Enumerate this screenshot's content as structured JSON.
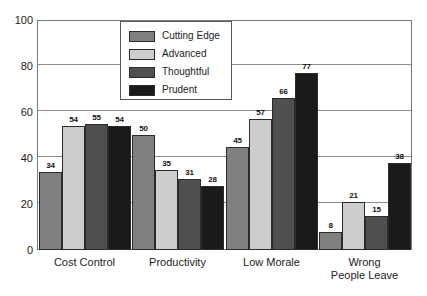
{
  "chart_data": {
    "type": "bar",
    "title": "",
    "xlabel": "",
    "ylabel": "",
    "ylim": [
      0,
      100
    ],
    "yticks": [
      "0",
      "20",
      "40",
      "60",
      "80",
      "100"
    ],
    "grid": true,
    "legend_position": "top-center-left inside plot",
    "categories": [
      "Cost Control",
      "Productivity",
      "Low Morale",
      "Wrong People Leave"
    ],
    "category_lines": [
      [
        "Cost Control"
      ],
      [
        "Productivity"
      ],
      [
        "Low Morale"
      ],
      [
        "Wrong",
        "People Leave"
      ]
    ],
    "series": [
      {
        "name": "Cutting Edge",
        "color": "#808080",
        "values": [
          34,
          50,
          45,
          8
        ]
      },
      {
        "name": "Advanced",
        "color": "#cdcdcd",
        "values": [
          54,
          35,
          57,
          21
        ]
      },
      {
        "name": "Thoughtful",
        "color": "#4f4f4f",
        "values": [
          55,
          31,
          66,
          15
        ]
      },
      {
        "name": "Prudent",
        "color": "#1a1a1a",
        "values": [
          54,
          28,
          77,
          38
        ]
      }
    ]
  },
  "legend": {
    "items": [
      {
        "label": "Cutting Edge"
      },
      {
        "label": "Advanced"
      },
      {
        "label": "Thoughtful"
      },
      {
        "label": "Prudent"
      }
    ]
  },
  "colors": {
    "cutting_edge": "#808080",
    "advanced": "#cdcdcd",
    "thoughtful": "#4f4f4f",
    "prudent": "#1a1a1a",
    "axis": "#7a7a7a",
    "grid": "#8c8c8c",
    "text": "#1c1c1c",
    "background": "#ffffff"
  }
}
